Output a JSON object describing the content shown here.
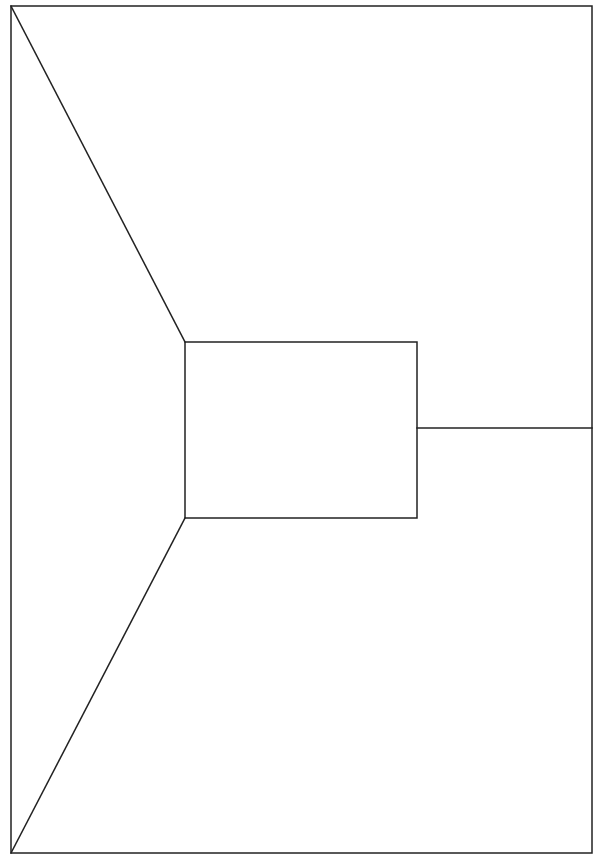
{
  "diagram": {
    "type": "line-drawing",
    "stroke_color": "#222222",
    "stroke_width": 1.5,
    "background": "#ffffff",
    "outer_frame": {
      "x": 11,
      "y": 6,
      "width": 581,
      "height": 847
    },
    "inner_rect": {
      "x": 185,
      "y": 342,
      "width": 232,
      "height": 176
    },
    "lines": [
      {
        "name": "diagonal-top-left",
        "x1": 11,
        "y1": 6,
        "x2": 185,
        "y2": 342
      },
      {
        "name": "diagonal-bottom-left",
        "x1": 11,
        "y1": 853,
        "x2": 185,
        "y2": 518
      },
      {
        "name": "horizontal-right",
        "x1": 417,
        "y1": 428,
        "x2": 592,
        "y2": 428
      }
    ]
  }
}
